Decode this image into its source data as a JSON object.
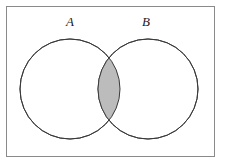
{
  "figure": {
    "kind": "venn-diagram",
    "caption": "",
    "background_color": "#ffffff"
  },
  "frame": {
    "name": "universal-set-rectangle",
    "x": 6,
    "y": 6,
    "width": 208,
    "height": 150,
    "stroke_color": "#8a8a8a",
    "stroke_width": 1,
    "fill_color": "#ffffff"
  },
  "circles": [
    {
      "id": "set-a",
      "label": "A",
      "cx": 70,
      "cy": 89,
      "r": 50,
      "stroke_color": "#3a3a3a",
      "stroke_width": 1,
      "fill_color": "#ffffff",
      "label_x": 70,
      "label_y": 26
    },
    {
      "id": "set-b",
      "label": "B",
      "cx": 148,
      "cy": 89,
      "r": 50,
      "stroke_color": "#3a3a3a",
      "stroke_width": 1,
      "fill_color": "#ffffff",
      "label_x": 146,
      "label_y": 26
    }
  ],
  "shaded_region": {
    "id": "intersection-a-and-b",
    "description": "A intersect B",
    "fill_color": "#bcbcbc",
    "stroke_color": "#3a3a3a",
    "stroke_width": 1,
    "top_crossing": {
      "x": 109,
      "y": 44
    },
    "bottom_crossing": {
      "x": 109,
      "y": 134
    }
  },
  "labels": {
    "set_a": "A",
    "set_b": "B"
  }
}
